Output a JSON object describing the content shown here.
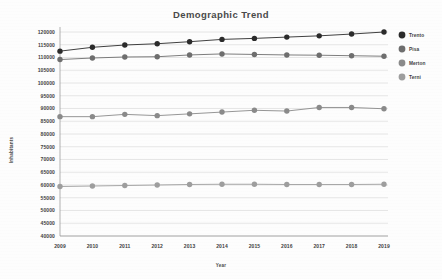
{
  "chart_data": {
    "type": "line",
    "title": "Demographic Trend",
    "xlabel": "Year",
    "ylabel": "Inhabitants",
    "categories": [
      "2009",
      "2010",
      "2011",
      "2012",
      "2013",
      "2014",
      "2015",
      "2016",
      "2017",
      "2018",
      "2019"
    ],
    "ylim": [
      40000,
      120000
    ],
    "ytick_step": 5000,
    "yticks": [
      40000,
      45000,
      50000,
      55000,
      60000,
      65000,
      70000,
      75000,
      80000,
      85000,
      90000,
      95000,
      100000,
      105000,
      110000,
      115000,
      120000
    ],
    "ytick_labels": [
      "40000",
      "45000",
      "50000",
      "55000",
      "60000",
      "65000",
      "70000",
      "75000",
      "80000",
      "85000",
      "90000",
      "95000",
      "100000",
      "105000",
      "110000",
      "115000",
      "120000"
    ],
    "grid": true,
    "legend_position": "right",
    "series": [
      {
        "name": "Trento",
        "color": "#2b2b2b",
        "values": [
          112500,
          114000,
          114900,
          115400,
          116200,
          117100,
          117500,
          118000,
          118500,
          119200,
          120000
        ]
      },
      {
        "name": "Pisa",
        "color": "#6e6e6e",
        "values": [
          109200,
          109800,
          110200,
          110300,
          111000,
          111400,
          111200,
          111000,
          110900,
          110700,
          110500
        ]
      },
      {
        "name": "Merton",
        "color": "#8a8a8a",
        "values": [
          86800,
          86800,
          87700,
          87200,
          87900,
          88600,
          89300,
          89000,
          90400,
          90400,
          89900
        ]
      },
      {
        "name": "Terni",
        "color": "#9e9e9e",
        "values": [
          59400,
          59600,
          59800,
          60000,
          60200,
          60300,
          60300,
          60200,
          60200,
          60200,
          60300
        ]
      }
    ]
  },
  "legend": {
    "items": [
      {
        "label": "Trento",
        "marker": "circle-marker"
      },
      {
        "label": "Pisa",
        "marker": "circle-marker"
      },
      {
        "label": "Merton",
        "marker": "circle-marker"
      },
      {
        "label": "Terni",
        "marker": "circle-marker"
      }
    ]
  }
}
